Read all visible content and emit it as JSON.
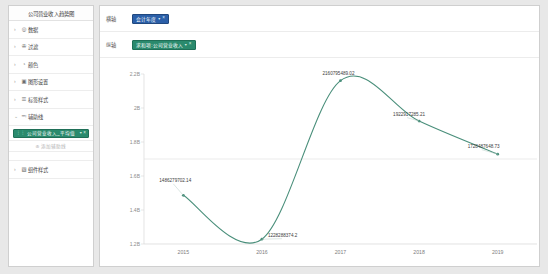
{
  "sidebar": {
    "title": "公司营业收入趋势图",
    "items": [
      {
        "label": "数据",
        "icon": "database-icon",
        "glyph": "◎",
        "caret": "›",
        "expanded": false
      },
      {
        "label": "过滤",
        "icon": "filter-icon",
        "glyph": "✇",
        "caret": "›",
        "expanded": false
      },
      {
        "label": "颜色",
        "icon": "palette-icon",
        "glyph": "◔",
        "caret": "›",
        "expanded": false
      },
      {
        "label": "图形设置",
        "icon": "shape-settings-icon",
        "glyph": "▣",
        "caret": "›",
        "expanded": false
      },
      {
        "label": "标签样式",
        "icon": "label-icon",
        "glyph": "☰",
        "caret": "›",
        "expanded": false
      },
      {
        "label": "辅助线",
        "icon": "guideline-icon",
        "glyph": "≕",
        "caret": "⌄",
        "expanded": true
      },
      {
        "label": "组件样式",
        "icon": "component-style-icon",
        "glyph": "▧",
        "caret": "›",
        "expanded": false
      }
    ],
    "selected_field": {
      "grip": "⋮⋮",
      "text": "公司营业收入_平均值",
      "caret": "▾",
      "close": "×"
    },
    "add_hint": {
      "plus": "⊕",
      "text": "添加辅助线"
    }
  },
  "shelves": [
    {
      "label": "横轴",
      "pill": {
        "text": "会计年度",
        "caret": "▾",
        "close": "×",
        "color": "#2b5fa8",
        "kind": "dimension"
      }
    },
    {
      "label": "纵轴",
      "pill": {
        "text": "求和项:公司营业收入",
        "caret": "▾",
        "close": "×",
        "color": "#2a8a6d",
        "kind": "measure"
      }
    }
  ],
  "chart_data": {
    "type": "line",
    "title": "公司营业收入趋势图",
    "xlabel": "会计年度",
    "ylabel": "求和项:公司营业收入",
    "categories": [
      "2015",
      "2016",
      "2017",
      "2018",
      "2019"
    ],
    "series": [
      {
        "name": "求和项:公司营业收入",
        "color": "#4a8f7b",
        "values": [
          1486279702.14,
          1228288374.2,
          2160795489.02,
          1922917285.21,
          1728487648.73
        ]
      }
    ],
    "data_labels": [
      "1486279702.14",
      "1228288374.2",
      "2160795489.02",
      "1922917285.21",
      "1728487648.73"
    ],
    "yticks": [
      "2.2B",
      "2B",
      "1.8B",
      "1.6B",
      "1.4B",
      "1.2B"
    ],
    "ytick_values": [
      2200000000,
      2000000000,
      1800000000,
      1600000000,
      1400000000,
      1200000000
    ],
    "ylim": [
      1200000000,
      2200000000
    ],
    "grid": false,
    "legend": "none",
    "smooth": true
  }
}
